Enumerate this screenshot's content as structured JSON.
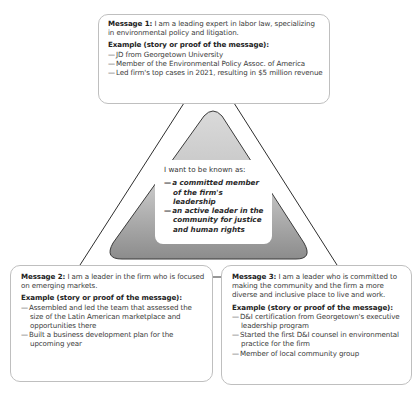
{
  "center": {
    "lead": "I want to be known as:",
    "items": [
      "a committed member of the firm's leadership",
      "an active leader in the community for justice and human rights"
    ]
  },
  "messages": [
    {
      "label": "Message 1:",
      "text": "I am a leading expert in labor law, specializing in environmental policy and litigation.",
      "example_title": "Example (story or proof of the message):",
      "examples": [
        "JD from Georgetown University",
        "Member of the Environmental Policy Assoc. of America",
        "Led firm's top cases in 2021, resulting in $5 million revenue"
      ]
    },
    {
      "label": "Message 2:",
      "text": "I am a leader in the firm who is focused on emerging markets.",
      "example_title": "Example (story or proof of the message):",
      "examples": [
        "Assembled and led the team that assessed the size of the Latin American marketplace and opportunities there",
        "Built a business development plan for the upcoming year"
      ]
    },
    {
      "label": "Message 3:",
      "text": "I am a leader who is committed to making the community and the firm a more diverse and inclusive place to live and work.",
      "example_title": "Example (story or proof of the message):",
      "examples": [
        "D&I certification from Georgetown's executive leadership program",
        "Started the first D&I counsel in environmental practice for the firm",
        "Member of local community group"
      ]
    }
  ],
  "colors": {
    "triangle_fill_top": "#d6d6d6",
    "triangle_fill_bottom": "#8a8a8a",
    "line": "#333333",
    "box_border": "#bfbfbf"
  }
}
